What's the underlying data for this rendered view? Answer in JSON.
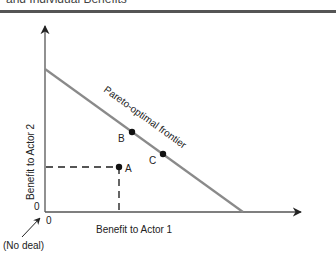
{
  "header": {
    "title_partial": "and Individual Benefits"
  },
  "diagram": {
    "type": "pareto-frontier",
    "frontier_label": "Pareto-optimal frontier",
    "x_axis_label": "Benefit to Actor 1",
    "y_axis_label": "Benefit to Actor 2",
    "x_origin_label": "0",
    "y_origin_label": "0",
    "no_deal_label": "(No deal)",
    "points": [
      {
        "id": "A",
        "label": "A",
        "position": "inside frontier, with dashed projections to both axes"
      },
      {
        "id": "B",
        "label": "B",
        "position": "on frontier"
      },
      {
        "id": "C",
        "label": "C",
        "position": "on frontier"
      }
    ],
    "colors": {
      "frontier": "#8a8a8a",
      "axes": "#444444",
      "points": "#111111",
      "dashes": "#555555"
    }
  }
}
